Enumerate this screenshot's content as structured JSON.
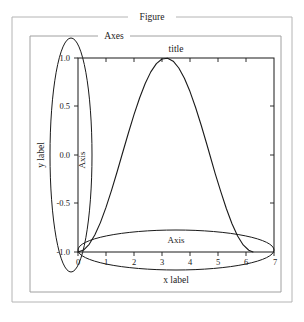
{
  "figure": {
    "frame_label": "Figure",
    "frame_color": "#b4b4b4"
  },
  "axes": {
    "frame_label": "Axes",
    "frame_color": "#a0a0a0",
    "title": "title",
    "x_axis_label": "x label",
    "y_axis_label": "y label",
    "x_axis_name": "Axis",
    "y_axis_name": "Axis",
    "spine_color": "#1a1a1a"
  },
  "annotations": {
    "x_axis_ellipse": "x-axis-highlight-ellipse",
    "y_axis_ellipse": "y-axis-highlight-ellipse",
    "ellipse_color": "#1a1a1a"
  },
  "chart_data": {
    "type": "line",
    "title": "title",
    "xlabel": "x label",
    "ylabel": "y label",
    "xlim": [
      0,
      7
    ],
    "ylim": [
      -1.0,
      1.0
    ],
    "xticks": [
      0,
      1,
      2,
      3,
      4,
      5,
      6,
      7
    ],
    "xticklabels": [
      "0",
      "1",
      "2",
      "3",
      "4",
      "5",
      "6",
      "7"
    ],
    "yticks": [
      -1.0,
      -0.5,
      0.0,
      0.5,
      1.0
    ],
    "yticklabels": [
      "-1.0",
      "-0.5",
      "0.0",
      "0.5",
      "1.0"
    ],
    "grid": false,
    "legend": null,
    "series": [
      {
        "name": "curve",
        "color": "#1a1a1a",
        "x": [
          0.0,
          0.2,
          0.4,
          0.6,
          0.8,
          1.0,
          1.2,
          1.4,
          1.57,
          1.8,
          2.0,
          2.2,
          2.4,
          2.6,
          2.8,
          3.0,
          3.2,
          3.4,
          3.6,
          3.8,
          4.0,
          4.2,
          4.4,
          4.6,
          4.71,
          4.9,
          5.1,
          5.3,
          5.5,
          5.7,
          5.9,
          6.1,
          6.25
        ],
        "y": [
          -1.0,
          -0.98,
          -0.921,
          -0.825,
          -0.697,
          -0.54,
          -0.362,
          -0.17,
          0.0,
          0.227,
          0.416,
          0.588,
          0.737,
          0.857,
          0.942,
          0.99,
          0.998,
          0.967,
          0.897,
          0.791,
          0.654,
          0.49,
          0.307,
          0.111,
          0.0,
          -0.191,
          -0.378,
          -0.554,
          -0.709,
          -0.835,
          -0.927,
          -0.982,
          -0.999
        ]
      }
    ]
  }
}
